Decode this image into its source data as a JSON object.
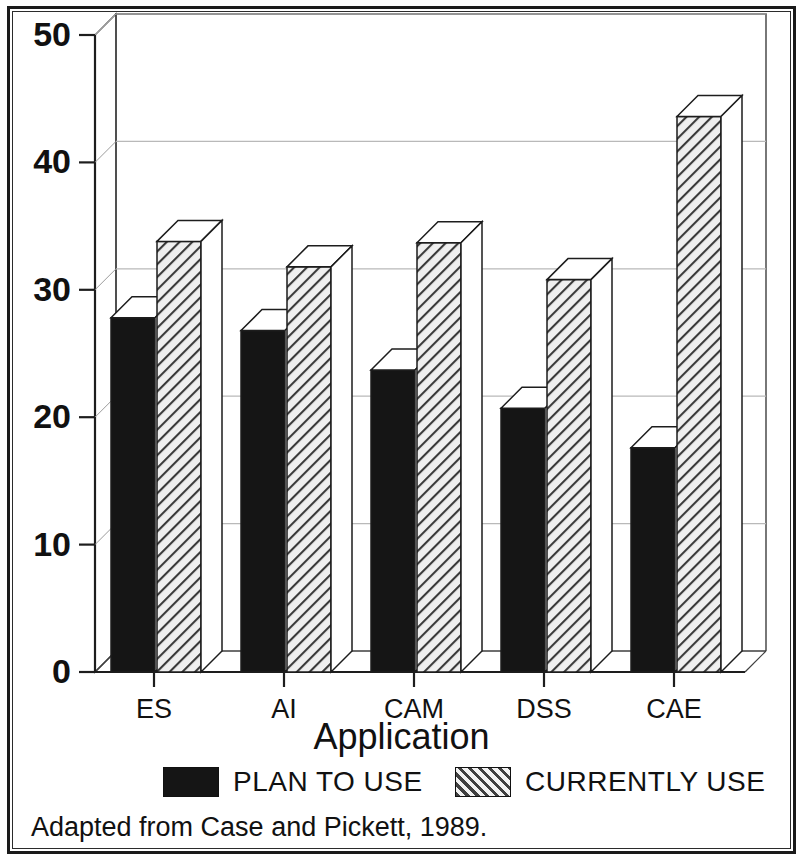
{
  "chart_data": {
    "type": "bar",
    "title": "",
    "xlabel": "Application",
    "ylabel": "",
    "categories": [
      "ES",
      "AI",
      "CAM",
      "DSS",
      "CAE"
    ],
    "series": [
      {
        "name": "PLAN TO USE",
        "values": [
          27.8,
          26.8,
          23.7,
          20.7,
          17.6
        ]
      },
      {
        "name": "CURRENTLY USE",
        "values": [
          33.8,
          31.8,
          33.7,
          30.8,
          43.6
        ]
      }
    ],
    "ylim": [
      0,
      50
    ],
    "yticks": [
      0,
      10,
      20,
      30,
      40,
      50
    ],
    "ytick_labels": [
      "0",
      "10",
      "20",
      "30",
      "40",
      "50"
    ],
    "grid": true,
    "grid_axis": "y",
    "legend_position": "bottom",
    "style": "3d-bars",
    "colors": {
      "plan_to_use": "#151515",
      "currently_use": "#d8d8d8",
      "axis": "#111111",
      "grid": "#bdbdbd"
    }
  },
  "yaxis": {
    "ticks": [
      {
        "label": "50",
        "value": 50
      },
      {
        "label": "40",
        "value": 40
      },
      {
        "label": "30",
        "value": 30
      },
      {
        "label": "20",
        "value": 20
      },
      {
        "label": "10",
        "value": 10
      },
      {
        "label": "0",
        "value": 0
      }
    ]
  },
  "xaxis": {
    "title": "Application",
    "ticks": [
      {
        "label": "ES"
      },
      {
        "label": "AI"
      },
      {
        "label": "CAM"
      },
      {
        "label": "DSS"
      },
      {
        "label": "CAE"
      }
    ]
  },
  "legend": {
    "items": [
      {
        "label": "PLAN TO USE",
        "pattern": "solid"
      },
      {
        "label": "CURRENTLY USE",
        "pattern": "hatch"
      }
    ]
  },
  "caption": {
    "text": "Adapted from Case and Pickett, 1989."
  }
}
